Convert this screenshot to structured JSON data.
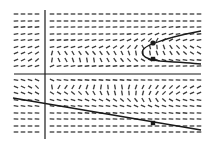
{
  "figure": {
    "type": "slope-field",
    "width": 212,
    "height": 148,
    "colors": {
      "background": "#ffffff",
      "ink": "#1a1a1a",
      "dash": "#3a3a3a"
    },
    "axes": {
      "x_axis_y": 74,
      "y_axis_x": 45,
      "x_range": [
        14,
        201
      ],
      "y_range": [
        10,
        139
      ]
    },
    "grid": {
      "columns_x": [
        16,
        23,
        30,
        37,
        52,
        59,
        66,
        73,
        80,
        87,
        94,
        101,
        108,
        115,
        122,
        129,
        136,
        143,
        150,
        157,
        164,
        171,
        178,
        185,
        192,
        199
      ],
      "rows_y": [
        14,
        21,
        27,
        34,
        40,
        47,
        53,
        60,
        66,
        80,
        87,
        93,
        100,
        106,
        113,
        119,
        126,
        132
      ],
      "dash_length": 4.6
    },
    "slope_rows_deg": [
      [
        0,
        0,
        0,
        0,
        0,
        0,
        0,
        0,
        0,
        0,
        0,
        0,
        0,
        0,
        0,
        0,
        0,
        0,
        0,
        0,
        0,
        0,
        0,
        0,
        0,
        0
      ],
      [
        5,
        5,
        5,
        5,
        0,
        0,
        0,
        0,
        0,
        0,
        0,
        0,
        0,
        0,
        0,
        0,
        0,
        0,
        0,
        0,
        0,
        0,
        0,
        0,
        0,
        0
      ],
      [
        6,
        6,
        6,
        6,
        2,
        2,
        2,
        2,
        2,
        2,
        2,
        2,
        2,
        2,
        2,
        2,
        2,
        5,
        5,
        8,
        8,
        8,
        6,
        5,
        4,
        3
      ],
      [
        8,
        8,
        8,
        8,
        4,
        4,
        4,
        4,
        4,
        4,
        4,
        4,
        4,
        5,
        5,
        6,
        8,
        12,
        18,
        20,
        18,
        15,
        12,
        10,
        8,
        6
      ],
      [
        10,
        10,
        10,
        12,
        6,
        6,
        6,
        6,
        8,
        8,
        8,
        8,
        10,
        12,
        15,
        20,
        30,
        35,
        45,
        60,
        40,
        30,
        22,
        18,
        14,
        10
      ],
      [
        14,
        14,
        16,
        20,
        12,
        14,
        16,
        16,
        18,
        20,
        22,
        24,
        28,
        32,
        38,
        45,
        55,
        -60,
        -75,
        -85,
        -70,
        -55,
        -45,
        -38,
        -30,
        -25
      ],
      [
        20,
        22,
        26,
        35,
        75,
        -60,
        -55,
        -60,
        -55,
        -50,
        -50,
        -55,
        -55,
        -60,
        -65,
        -70,
        -80,
        -85,
        -80,
        -70,
        -65,
        -58,
        -50,
        -42,
        -35,
        -30
      ],
      [
        22,
        26,
        30,
        40,
        80,
        -65,
        -60,
        -70,
        -75,
        -80,
        -80,
        -65,
        -60,
        -55,
        -50,
        -45,
        -40,
        -30,
        -25,
        -20,
        -18,
        -15,
        -12,
        -10,
        -8,
        -6
      ],
      [
        10,
        12,
        14,
        18,
        20,
        10,
        8,
        8,
        6,
        6,
        6,
        6,
        6,
        6,
        6,
        6,
        6,
        4,
        4,
        4,
        4,
        4,
        4,
        4,
        4,
        4
      ],
      [
        -12,
        -14,
        -16,
        -22,
        -20,
        -10,
        -8,
        -6,
        -6,
        -6,
        -6,
        -6,
        -6,
        -6,
        -6,
        -6,
        -5,
        -4,
        -4,
        -4,
        -4,
        -4,
        -4,
        -4,
        -4,
        -4
      ],
      [
        -22,
        -26,
        -30,
        -45,
        -80,
        60,
        55,
        60,
        65,
        70,
        75,
        80,
        -85,
        -80,
        -80,
        75,
        70,
        65,
        60,
        55,
        50,
        45,
        40,
        35,
        30,
        28
      ],
      [
        -18,
        -20,
        -24,
        -28,
        -32,
        -30,
        -35,
        -40,
        -45,
        -55,
        -60,
        -65,
        -70,
        -75,
        -80,
        -85,
        85,
        75,
        65,
        55,
        45,
        38,
        32,
        28,
        24,
        20
      ],
      [
        -10,
        -10,
        -12,
        -14,
        -14,
        -14,
        -14,
        -16,
        -18,
        -20,
        -22,
        -26,
        -30,
        -35,
        -40,
        -45,
        -50,
        -60,
        -65,
        -55,
        -40,
        -30,
        -24,
        -18,
        -14,
        -10
      ],
      [
        -8,
        -8,
        -8,
        -8,
        -8,
        -8,
        -8,
        -8,
        -10,
        -10,
        -10,
        -12,
        -12,
        -14,
        -16,
        -18,
        -20,
        -22,
        -24,
        -22,
        -18,
        -14,
        -12,
        -10,
        -8,
        -6
      ],
      [
        -5,
        -5,
        -5,
        -5,
        -5,
        -5,
        -5,
        -5,
        -6,
        -6,
        -6,
        -6,
        -6,
        -6,
        -8,
        -8,
        -8,
        -10,
        -10,
        -10,
        -8,
        -8,
        -6,
        -6,
        -5,
        -5
      ],
      [
        -3,
        -3,
        -3,
        -3,
        -3,
        -3,
        -3,
        -3,
        -3,
        -3,
        -3,
        -3,
        -3,
        -3,
        -4,
        -4,
        -4,
        -4,
        -5,
        -5,
        -4,
        -4,
        -4,
        -3,
        -3,
        -3
      ],
      [
        0,
        0,
        0,
        0,
        0,
        0,
        0,
        0,
        0,
        0,
        0,
        0,
        0,
        0,
        0,
        0,
        0,
        0,
        0,
        0,
        0,
        0,
        0,
        0,
        0,
        0
      ],
      [
        0,
        0,
        0,
        0,
        0,
        0,
        0,
        0,
        0,
        0,
        0,
        0,
        0,
        0,
        0,
        0,
        0,
        0,
        0,
        0,
        0,
        0,
        0,
        0,
        0,
        0
      ]
    ],
    "curves": [
      {
        "name": "upper-parabola-solution",
        "path": "M 201 31 C 185 34, 165 39, 155 43 C 146 46, 140 50, 143 55 C 146 59, 152 60, 160 61 C 175 62, 190 63, 201 64",
        "stroke_width": 1.3
      },
      {
        "name": "lower-line-solution",
        "path": "M 13 98 L 201 130",
        "stroke_width": 1.3
      }
    ],
    "markers": [
      {
        "name": "upper-circle-marker",
        "shape": "circle",
        "x": 153,
        "y": 43,
        "size": 2.6
      },
      {
        "name": "middle-square-marker",
        "shape": "square",
        "x": 153,
        "y": 59,
        "size": 4.4
      },
      {
        "name": "lower-square-marker",
        "shape": "square",
        "x": 153,
        "y": 123,
        "size": 4.4
      }
    ]
  }
}
